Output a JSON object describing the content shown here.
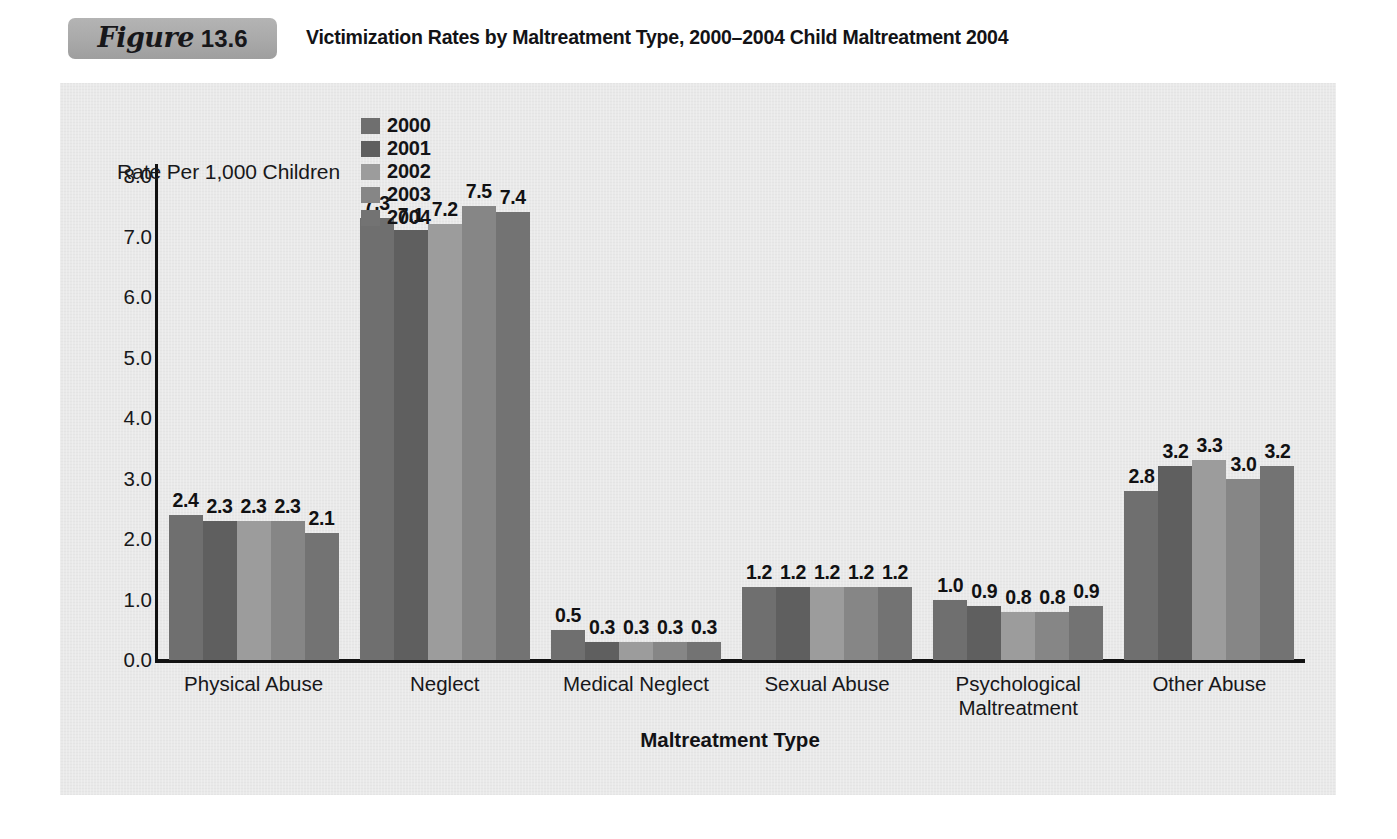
{
  "header": {
    "figure_word": "Figure",
    "figure_number": "13.6",
    "title": "Victimization Rates by Maltreatment Type, 2000–2004 Child Maltreatment 2004"
  },
  "legend": {
    "axis_title": "Rate Per 1,000 Children",
    "items": [
      {
        "label": "2000",
        "color": "#6f6f6f"
      },
      {
        "label": "2001",
        "color": "#5f5f5f"
      },
      {
        "label": "2002",
        "color": "#9c9c9c"
      },
      {
        "label": "2003",
        "color": "#868686"
      },
      {
        "label": "2004",
        "color": "#737373"
      }
    ]
  },
  "axes": {
    "y_ticks": [
      "8.0",
      "7.0",
      "6.0",
      "5.0",
      "4.0",
      "3.0",
      "2.0",
      "1.0",
      "0.0"
    ],
    "x_title": "Maltreatment Type"
  },
  "chart_data": {
    "type": "bar",
    "title": "Victimization Rates by Maltreatment Type, 2000–2004 Child Maltreatment 2004",
    "xlabel": "Maltreatment Type",
    "ylabel": "Rate Per 1,000 Children",
    "ylim": [
      0.0,
      8.0
    ],
    "ytick_step": 1.0,
    "grid": false,
    "legend_position": "top",
    "categories": [
      "Physical Abuse",
      "Neglect",
      "Medical Neglect",
      "Sexual Abuse",
      "Psychological Maltreatment",
      "Other Abuse"
    ],
    "category_lines": [
      [
        "Physical Abuse"
      ],
      [
        "Neglect"
      ],
      [
        "Medical Neglect"
      ],
      [
        "Sexual Abuse"
      ],
      [
        "Psychological",
        "Maltreatment"
      ],
      [
        "Other Abuse"
      ]
    ],
    "series": [
      {
        "name": "2000",
        "color": "#6f6f6f",
        "values": [
          2.4,
          7.3,
          0.5,
          1.2,
          1.0,
          2.8
        ],
        "labels": [
          "2.4",
          "7.3",
          "0.5",
          "1.2",
          "1.0",
          "2.8"
        ]
      },
      {
        "name": "2001",
        "color": "#5f5f5f",
        "values": [
          2.3,
          7.1,
          0.3,
          1.2,
          0.9,
          3.2
        ],
        "labels": [
          "2.3",
          "7.1",
          "0.3",
          "1.2",
          "0.9",
          "3.2"
        ]
      },
      {
        "name": "2002",
        "color": "#9c9c9c",
        "values": [
          2.3,
          7.2,
          0.3,
          1.2,
          0.8,
          3.3
        ],
        "labels": [
          "2.3",
          "7.2",
          "0.3",
          "1.2",
          "0.8",
          "3.3"
        ]
      },
      {
        "name": "2003",
        "color": "#868686",
        "values": [
          2.3,
          7.5,
          0.3,
          1.2,
          0.8,
          3.0
        ],
        "labels": [
          "2.3",
          "7.5",
          "0.3",
          "1.2",
          "0.8",
          "3.0"
        ]
      },
      {
        "name": "2004",
        "color": "#737373",
        "values": [
          2.1,
          7.4,
          0.3,
          1.2,
          0.9,
          3.2
        ],
        "labels": [
          "2.1",
          "7.4",
          "0.3",
          "1.2",
          "0.9",
          "3.2"
        ]
      }
    ]
  }
}
